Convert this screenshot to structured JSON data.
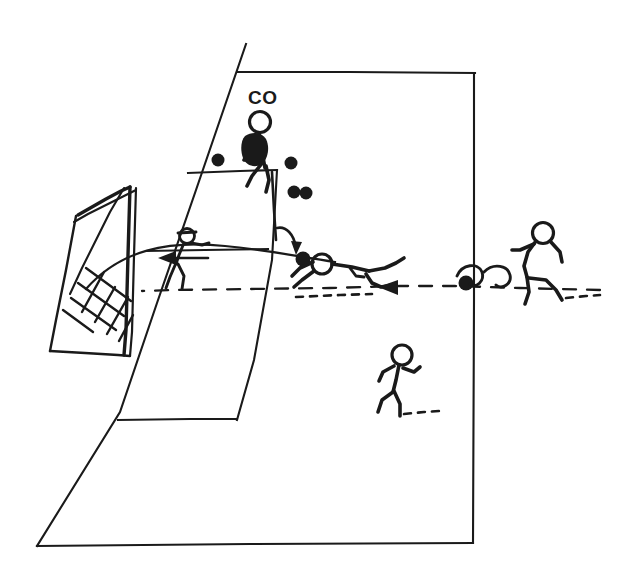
{
  "diagram": {
    "style": "hand-drawn ink sketch",
    "background_color": "#ffffff",
    "ink_color": "#1a1a1a",
    "labels": [
      {
        "id": "coach",
        "text": "CO",
        "x": 248,
        "y": 104
      }
    ],
    "field": {
      "name": "penalty-area-perspective",
      "outline_points": "246,44 116,420 36,546 473,543 475,73 238,72",
      "description": "Trapezoidal perspective view of one half of a pitch with goal at left"
    },
    "goal": {
      "name": "goal-with-net",
      "description": "Goal frame drawn in perspective with cross-hatched net panel"
    },
    "balls": [
      {
        "id": "ball-1",
        "x": 218,
        "y": 160,
        "r": 6.5
      },
      {
        "id": "ball-2",
        "x": 291,
        "y": 163,
        "r": 6.5
      },
      {
        "id": "ball-3",
        "x": 294,
        "y": 192,
        "r": 6.5
      },
      {
        "id": "ball-4",
        "x": 306,
        "y": 193,
        "r": 6.5
      },
      {
        "id": "ball-served",
        "x": 303,
        "y": 259,
        "r": 7.5
      },
      {
        "id": "ball-kicked",
        "x": 466,
        "y": 283,
        "r": 7.5
      }
    ],
    "figures": [
      {
        "id": "coach-figure",
        "role": "coach serving balls",
        "x": 262,
        "y": 155
      },
      {
        "id": "goalkeeper-diving",
        "role": "goalkeeper diving for ball",
        "x": 340,
        "y": 265
      },
      {
        "id": "goalkeeper-at-post",
        "role": "goalkeeper moving to near post",
        "x": 185,
        "y": 250
      },
      {
        "id": "shooter-right",
        "role": "player striking ball",
        "x": 545,
        "y": 250
      },
      {
        "id": "runner-bottom",
        "role": "player running",
        "x": 398,
        "y": 380
      }
    ],
    "arrows": [
      {
        "id": "serve-arrow",
        "type": "curved",
        "from": "coach",
        "to": "ball-served"
      },
      {
        "id": "recover-arrow",
        "type": "straight-left",
        "from": "goal-area",
        "to": "near-post"
      },
      {
        "id": "shot-arrow",
        "type": "dashed-left",
        "from": "shooter-right",
        "to": "goal"
      }
    ]
  }
}
